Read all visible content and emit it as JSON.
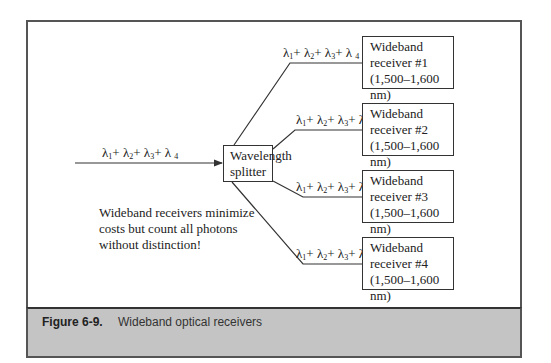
{
  "figure": {
    "number": "Figure 6-9.",
    "caption": "Wideband optical receivers"
  },
  "input": {
    "label": "λ1+ λ2+ λ3+ λ4",
    "terms": [
      {
        "symbol": "λ",
        "sub": "1",
        "sep": "+ "
      },
      {
        "symbol": "λ",
        "sub": "2",
        "sep": "+ "
      },
      {
        "symbol": "λ",
        "sub": "3",
        "sep": "+ "
      },
      {
        "symbol": "λ ",
        "sub": "4",
        "sep": ""
      }
    ]
  },
  "splitter": {
    "line1": "Wavelength",
    "line2": "splitter"
  },
  "branches": [
    {
      "label": "λ1+ λ2+ λ3+ λ4"
    },
    {
      "label": "λ1+ λ2+ λ3+ λ4"
    },
    {
      "label": "λ1+ λ2+ λ3+ λ4"
    },
    {
      "label": "λ1+ λ2+ λ3+ λ4"
    }
  ],
  "receivers": [
    {
      "line1": "Wideband",
      "line2": "receiver #1",
      "line3": "(1,500–1,600 nm)"
    },
    {
      "line1": "Wideband",
      "line2": "receiver #2",
      "line3": "(1,500–1,600 nm)"
    },
    {
      "line1": "Wideband",
      "line2": "receiver #3",
      "line3": "(1,500–1,600 nm)"
    },
    {
      "line1": "Wideband",
      "line2": "receiver #4",
      "line3": "(1,500–1,600 nm)"
    }
  ],
  "note": {
    "line1": "Wideband receivers minimize",
    "line2": "costs but count all photons",
    "line3": "without distinction!"
  },
  "colors": {
    "line": "#333333",
    "caption_bg": "#c4c4c4",
    "frame": "#555555"
  }
}
